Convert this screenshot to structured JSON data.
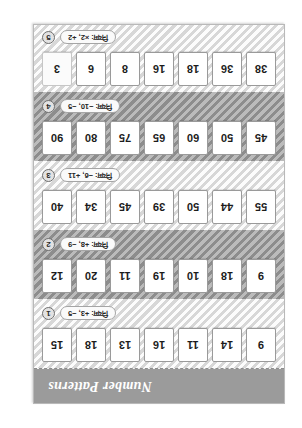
{
  "worksheet": {
    "title": "Number Patterns",
    "orientation_degrees": 180,
    "colors": {
      "sheet_background": "#f3f3f3",
      "title_bar": "#9b9b9b",
      "title_text": "#ffffff",
      "row_light": "#ededed",
      "row_dark": "#9e9e9e",
      "cell_background": "#ffffff",
      "cell_border": "#9a9a9a"
    },
    "rows": [
      {
        "number": "1",
        "rule": "नियम: +3, −5",
        "rule_plain": "Rule: +3, -5",
        "shade": "light",
        "cells": [
          "15",
          "18",
          "13",
          "16",
          "11",
          "14",
          "9"
        ]
      },
      {
        "number": "2",
        "rule": "नियम: +8, −9",
        "rule_plain": "Rule: +8, -9",
        "shade": "dark",
        "cells": [
          "12",
          "20",
          "11",
          "19",
          "10",
          "18",
          "9"
        ]
      },
      {
        "number": "3",
        "rule": "नियम: −6, +11",
        "rule_plain": "Rule: -6, +11",
        "shade": "light",
        "cells": [
          "40",
          "34",
          "45",
          "39",
          "50",
          "44",
          "55"
        ]
      },
      {
        "number": "4",
        "rule": "नियम: −10, −5",
        "rule_plain": "Rule: -10, -5",
        "shade": "dark",
        "cells": [
          "90",
          "80",
          "75",
          "65",
          "60",
          "50",
          "45"
        ]
      },
      {
        "number": "5",
        "rule": "नियम: ×2, +2",
        "rule_plain": "Rule: x2, +2",
        "shade": "light",
        "cells": [
          "3",
          "6",
          "8",
          "16",
          "18",
          "36",
          "38"
        ]
      }
    ]
  }
}
